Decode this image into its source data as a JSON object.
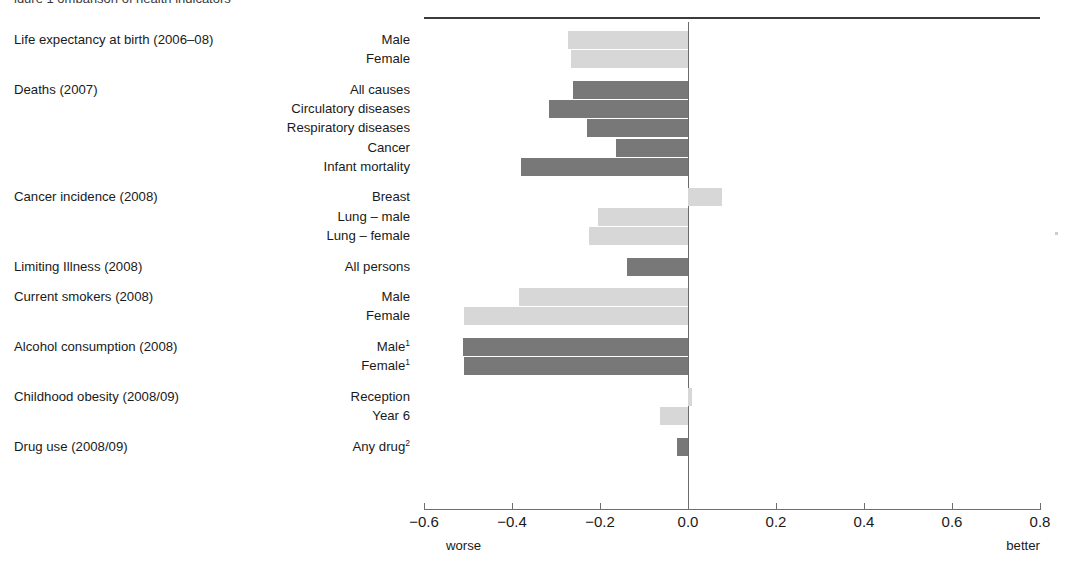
{
  "figure": {
    "clipped_title": "igure 1  omparison of health indicators",
    "axis_notes": {
      "left": "worse",
      "right": "better"
    }
  },
  "chart_data": {
    "type": "bar",
    "orientation": "horizontal",
    "title": "",
    "xlabel": "",
    "ylabel": "",
    "xlim": [
      -0.6,
      0.8
    ],
    "xticks": [
      "−0.6",
      "−0.4",
      "−0.2",
      "0.0",
      "0.2",
      "0.4",
      "0.6",
      "0.8"
    ],
    "xtick_values": [
      -0.6,
      -0.4,
      -0.2,
      0.0,
      0.2,
      0.4,
      0.6,
      0.8
    ],
    "grid": false,
    "legend": "none",
    "zero_reference_line": 0.0,
    "direction_annotations": {
      "negative": "worse",
      "positive": "better"
    },
    "colors": {
      "light": "#d7d7d7",
      "dark": "#787878",
      "axis": "#6e6e6e",
      "rule": "#3b3b3b"
    },
    "groups": [
      {
        "name": "Life expectancy at birth (2006–08)",
        "items": [
          {
            "label": "Male",
            "value": -0.272,
            "shade": "light"
          },
          {
            "label": "Female",
            "value": -0.266,
            "shade": "light"
          }
        ]
      },
      {
        "name": "Deaths (2007)",
        "items": [
          {
            "label": "All causes",
            "value": -0.261,
            "shade": "dark"
          },
          {
            "label": "Circulatory diseases",
            "value": -0.316,
            "shade": "dark"
          },
          {
            "label": "Respiratory diseases",
            "value": -0.23,
            "shade": "dark"
          },
          {
            "label": "Cancer",
            "value": -0.164,
            "shade": "dark"
          },
          {
            "label": "Infant mortality",
            "value": -0.38,
            "shade": "dark"
          }
        ]
      },
      {
        "name": "Cancer incidence (2008)",
        "items": [
          {
            "label": "Breast",
            "value": 0.077,
            "shade": "light"
          },
          {
            "label": "Lung – male",
            "value": -0.205,
            "shade": "light"
          },
          {
            "label": "Lung – female",
            "value": -0.225,
            "shade": "light"
          }
        ]
      },
      {
        "name": "Limiting Illness (2008)",
        "items": [
          {
            "label": "All persons",
            "value": -0.139,
            "shade": "dark"
          }
        ]
      },
      {
        "name": "Current smokers (2008)",
        "items": [
          {
            "label": "Male",
            "value": -0.384,
            "shade": "light"
          },
          {
            "label": "Female",
            "value": -0.509,
            "shade": "light"
          }
        ]
      },
      {
        "name": "Alcohol consumption (2008)",
        "items": [
          {
            "label": "Male¹",
            "label_text": "Male",
            "footnote": "1",
            "value": -0.512,
            "shade": "dark"
          },
          {
            "label": "Female¹",
            "label_text": "Female",
            "footnote": "1",
            "value": -0.51,
            "shade": "dark"
          }
        ]
      },
      {
        "name": "Childhood obesity (2008/09)",
        "items": [
          {
            "label": "Reception",
            "value": 0.01,
            "shade": "light"
          },
          {
            "label": "Year 6",
            "value": -0.064,
            "shade": "light"
          }
        ]
      },
      {
        "name": "Drug use (2008/09)",
        "items": [
          {
            "label": "Any drug²",
            "label_text": "Any drug",
            "footnote": "2",
            "value": -0.025,
            "shade": "dark"
          }
        ]
      }
    ]
  },
  "labels": {
    "groups": [
      "Life expectancy at birth (2006–08)",
      "Deaths (2007)",
      "Cancer incidence (2008)",
      "Limiting Illness (2008)",
      "Current smokers (2008)",
      "Alcohol consumption (2008)",
      "Childhood obesity (2008/09)",
      "Drug use (2008/09)"
    ]
  }
}
